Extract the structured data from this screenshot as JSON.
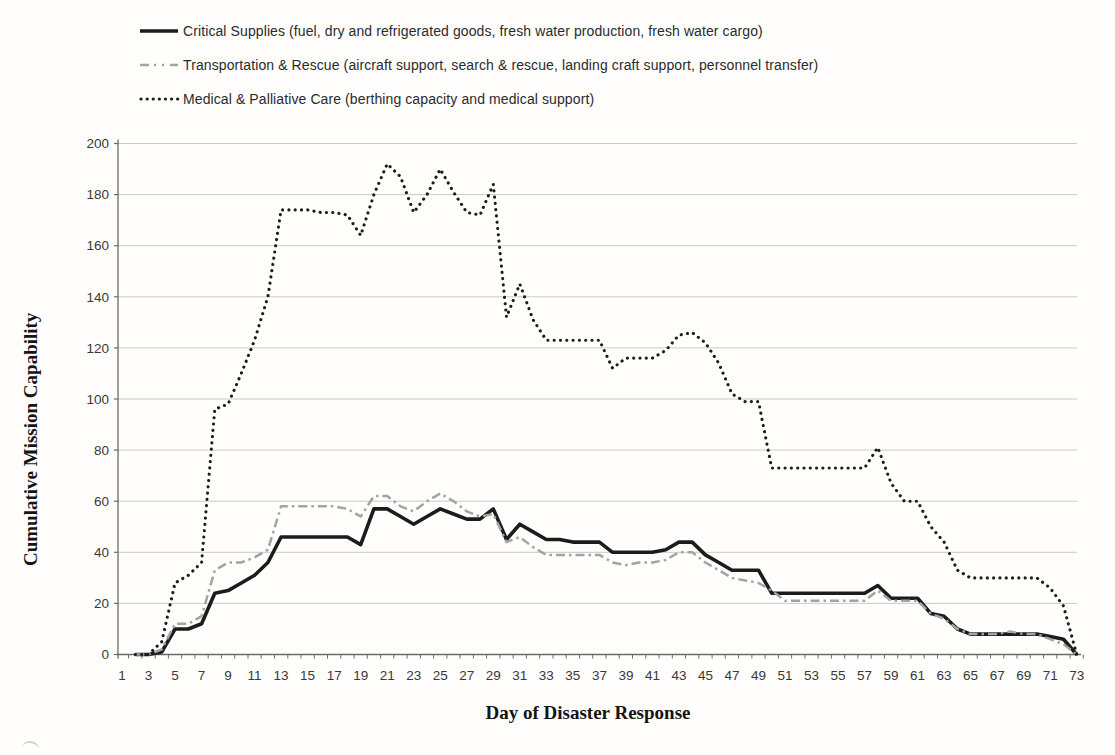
{
  "legend": {
    "items": [
      {
        "id": "critical-supplies",
        "label": "Critical Supplies (fuel, dry and refrigerated goods, fresh water production, fresh water cargo)",
        "style": "solid",
        "color": "#1c1c1c"
      },
      {
        "id": "transportation-rescue",
        "label": "Transportation & Rescue (aircraft support, search & rescue, landing craft support, personnel transfer)",
        "style": "dash-dot",
        "color": "#a3a3a3"
      },
      {
        "id": "medical-palliative",
        "label": "Medical & Palliative Care (berthing capacity and medical support)",
        "style": "dotted",
        "color": "#1c1c1c"
      }
    ]
  },
  "chart_data": {
    "type": "line",
    "title": "",
    "xlabel": "Day of Disaster Response",
    "ylabel": "Cumulative Mission Capability",
    "xlim": [
      1,
      73
    ],
    "ylim": [
      0,
      200
    ],
    "grid": "horizontal",
    "legend_position": "top-left",
    "x_ticks": [
      1,
      3,
      5,
      7,
      9,
      11,
      13,
      15,
      17,
      19,
      21,
      23,
      25,
      27,
      29,
      31,
      33,
      35,
      37,
      39,
      41,
      43,
      45,
      47,
      49,
      51,
      53,
      55,
      57,
      59,
      61,
      63,
      65,
      67,
      69,
      71,
      73
    ],
    "y_ticks": [
      0,
      20,
      40,
      60,
      80,
      100,
      120,
      140,
      160,
      180,
      200
    ],
    "colors": {
      "grid": "#c9c9c9",
      "axis": "#6b6b6b",
      "tick_text": "#383838"
    },
    "x": [
      1,
      2,
      3,
      4,
      5,
      6,
      7,
      8,
      9,
      10,
      11,
      12,
      13,
      14,
      15,
      16,
      17,
      18,
      19,
      20,
      21,
      22,
      23,
      24,
      25,
      26,
      27,
      28,
      29,
      30,
      31,
      32,
      33,
      34,
      35,
      36,
      37,
      38,
      39,
      40,
      41,
      42,
      43,
      44,
      45,
      46,
      47,
      48,
      49,
      50,
      51,
      52,
      53,
      54,
      55,
      56,
      57,
      58,
      59,
      60,
      61,
      62,
      63,
      64,
      65,
      66,
      67,
      68,
      69,
      70,
      71,
      72,
      73
    ],
    "series": [
      {
        "id": "critical-supplies",
        "name": "Critical Supplies (fuel, dry and refrigerated goods, fresh water production, fresh water cargo)",
        "style": "solid",
        "color": "#1c1c1c",
        "values": [
          null,
          0,
          0,
          1,
          10,
          10,
          12,
          24,
          25,
          28,
          31,
          36,
          46,
          46,
          46,
          46,
          46,
          46,
          43,
          57,
          57,
          54,
          51,
          54,
          57,
          55,
          53,
          53,
          57,
          45,
          51,
          48,
          45,
          45,
          44,
          44,
          44,
          40,
          40,
          40,
          40,
          41,
          44,
          44,
          39,
          36,
          33,
          33,
          33,
          24,
          24,
          24,
          24,
          24,
          24,
          24,
          24,
          27,
          22,
          22,
          22,
          16,
          15,
          10,
          8,
          8,
          8,
          8,
          8,
          8,
          7,
          6,
          0
        ]
      },
      {
        "id": "transportation-rescue",
        "name": "Transportation & Rescue (aircraft support, search & rescue, landing craft support, personnel transfer)",
        "style": "dash-dot",
        "color": "#a3a3a3",
        "values": [
          null,
          0,
          0,
          2,
          12,
          12,
          15,
          33,
          36,
          36,
          38,
          41,
          58,
          58,
          58,
          58,
          58,
          57,
          54,
          62,
          62,
          58,
          56,
          60,
          63,
          60,
          56,
          54,
          55,
          44,
          46,
          42,
          39,
          39,
          39,
          39,
          39,
          36,
          35,
          36,
          36,
          37,
          40,
          40,
          36,
          33,
          30,
          29,
          28,
          25,
          21,
          21,
          21,
          21,
          21,
          21,
          21,
          25,
          21,
          21,
          21,
          16,
          14,
          10,
          8,
          8,
          8,
          9,
          8,
          8,
          6,
          4,
          0
        ]
      },
      {
        "id": "medical-palliative",
        "name": "Medical & Palliative Care (berthing capacity and medical support)",
        "style": "dotted",
        "color": "#1c1c1c",
        "values": [
          null,
          0,
          0,
          5,
          28,
          31,
          36,
          96,
          98,
          110,
          123,
          140,
          174,
          174,
          174,
          173,
          173,
          172,
          164,
          180,
          192,
          187,
          173,
          180,
          190,
          181,
          173,
          172,
          184,
          132,
          145,
          131,
          123,
          123,
          123,
          123,
          123,
          112,
          116,
          116,
          116,
          119,
          125,
          126,
          122,
          114,
          102,
          99,
          99,
          73,
          73,
          73,
          73,
          73,
          73,
          73,
          73,
          81,
          67,
          60,
          60,
          50,
          44,
          33,
          30,
          30,
          30,
          30,
          30,
          30,
          26,
          19,
          0
        ]
      }
    ]
  }
}
